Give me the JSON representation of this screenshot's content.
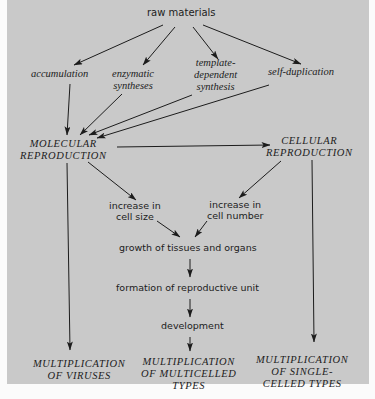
{
  "diagram": {
    "nodes": {
      "raw_materials": "raw materials",
      "accumulation": "accumulation",
      "enzymatic_syntheses": [
        "enzymatic",
        "syntheses"
      ],
      "template_dependent_synthesis": [
        "template-",
        "dependent",
        "synthesis"
      ],
      "self_duplication": "self-duplication",
      "molecular_reproduction": [
        "MOLECULAR",
        "REPRODUCTION"
      ],
      "cellular_reproduction": [
        "CELLULAR",
        "REPRODUCTION"
      ],
      "increase_cell_size": [
        "increase in",
        "cell size"
      ],
      "increase_cell_number": [
        "increase in",
        "cell number"
      ],
      "growth": "growth of tissues and organs",
      "formation": "formation of reproductive unit",
      "development": "development",
      "mult_viruses": [
        "MULTIPLICATION",
        "OF VIRUSES"
      ],
      "mult_multicelled": [
        "MULTIPLICATION",
        "OF MULTICELLED",
        "TYPES"
      ],
      "mult_single_celled": [
        "MULTIPLICATION",
        "OF SINGLE-",
        "CELLED TYPES"
      ]
    },
    "edges": [
      [
        "raw materials",
        "accumulation"
      ],
      [
        "raw materials",
        "enzymatic syntheses"
      ],
      [
        "raw materials",
        "template-dependent synthesis"
      ],
      [
        "raw materials",
        "self-duplication"
      ],
      [
        "accumulation",
        "MOLECULAR REPRODUCTION"
      ],
      [
        "enzymatic syntheses",
        "MOLECULAR REPRODUCTION"
      ],
      [
        "template-dependent synthesis",
        "MOLECULAR REPRODUCTION"
      ],
      [
        "self-duplication",
        "MOLECULAR REPRODUCTION"
      ],
      [
        "MOLECULAR REPRODUCTION",
        "CELLULAR REPRODUCTION"
      ],
      [
        "MOLECULAR REPRODUCTION",
        "increase in cell size"
      ],
      [
        "CELLULAR REPRODUCTION",
        "increase in cell number"
      ],
      [
        "increase in cell size",
        "growth of tissues and organs"
      ],
      [
        "increase in cell number",
        "growth of tissues and organs"
      ],
      [
        "growth of tissues and organs",
        "formation of reproductive unit"
      ],
      [
        "formation of reproductive unit",
        "development"
      ],
      [
        "development",
        "MULTIPLICATION OF MULTICELLED TYPES"
      ],
      [
        "MOLECULAR REPRODUCTION",
        "MULTIPLICATION OF VIRUSES"
      ],
      [
        "CELLULAR REPRODUCTION",
        "MULTIPLICATION OF SINGLE-CELLED TYPES"
      ]
    ],
    "colors": {
      "background": "#c9c9c9",
      "ink": "#1c1c1c",
      "margin": "#fbfbfb"
    }
  }
}
